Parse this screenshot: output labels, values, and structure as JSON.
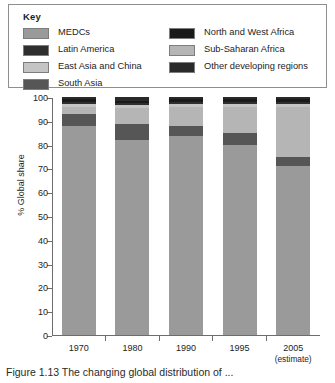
{
  "key": {
    "title": "Key",
    "left_items": [
      {
        "label": "MEDCs",
        "color": "#9a9a9a"
      },
      {
        "label": "Latin America",
        "color": "#2e2e2e"
      },
      {
        "label": "East Asia and China",
        "color": "#c4c4c4"
      },
      {
        "label": "South Asia",
        "color": "#565656"
      }
    ],
    "right_items": [
      {
        "label": "North and West Africa",
        "color": "#1a1a1a"
      },
      {
        "label": "Sub-Saharan Africa",
        "color": "#b5b5b5"
      },
      {
        "label": "Other developing regions",
        "color": "#2a2a2a"
      }
    ]
  },
  "caption": "Figure 1.13   The changing global distribution of ...",
  "chart_data": {
    "type": "bar",
    "stacked": true,
    "title": "",
    "xlabel": "",
    "ylabel": "% Global share",
    "ylim": [
      0,
      100
    ],
    "ytick_step": 10,
    "yticks": [
      0,
      10,
      20,
      30,
      40,
      50,
      60,
      70,
      80,
      90,
      100
    ],
    "grid": false,
    "legend_position": "top",
    "categories": [
      "1970",
      "1980",
      "1990",
      "1995",
      "2005"
    ],
    "category_sublabels": [
      "",
      "",
      "",
      "",
      "(estimate)"
    ],
    "series": [
      {
        "name": "MEDCs",
        "color": "#9a9a9a",
        "values": [
          88.0,
          82.0,
          83.5,
          80.0,
          71.0
        ]
      },
      {
        "name": "South Asia",
        "color": "#565656",
        "values": [
          5.0,
          6.5,
          4.5,
          5.0,
          4.0
        ]
      },
      {
        "name": "Sub-Saharan Africa",
        "color": "#b5b5b5",
        "values": [
          3.0,
          7.0,
          8.0,
          11.0,
          21.0
        ]
      },
      {
        "name": "East Asia and China",
        "color": "#c4c4c4",
        "values": [
          1.0,
          1.0,
          1.0,
          1.0,
          1.0
        ]
      },
      {
        "name": "Latin America",
        "color": "#2e2e2e",
        "values": [
          1.0,
          1.0,
          1.0,
          1.0,
          1.0
        ]
      },
      {
        "name": "North and West Africa",
        "color": "#1a1a1a",
        "values": [
          1.0,
          1.0,
          1.0,
          1.0,
          1.0
        ]
      },
      {
        "name": "Other developing regions",
        "color": "#2a2a2a",
        "values": [
          1.0,
          1.5,
          1.0,
          1.0,
          1.0
        ]
      }
    ]
  }
}
